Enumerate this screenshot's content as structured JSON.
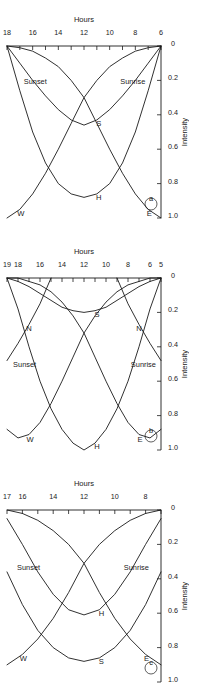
{
  "figure": {
    "orientation_deg": 180,
    "panel_count": 3,
    "ink_color": "#1a1a1a",
    "background": "#ffffff"
  },
  "chart_data": [
    {
      "id": "panel-c",
      "panel_label": "c",
      "type": "line",
      "title": "",
      "xlabel": "Hours",
      "ylabel": "Intensity",
      "xlim": [
        7,
        17
      ],
      "ylim": [
        0,
        1.0
      ],
      "xticks": [
        7,
        8,
        9,
        10,
        11,
        12,
        13,
        14,
        15,
        16,
        17
      ],
      "xticklabels": [
        "",
        "8",
        "",
        "10",
        "",
        "12",
        "",
        "14",
        "",
        "16",
        "17"
      ],
      "yticks": [
        0,
        0.2,
        0.4,
        0.6,
        0.8,
        1.0
      ],
      "yticklabels": [
        "0",
        "0.2",
        "0.4",
        "0.6",
        "0.8",
        "1.0"
      ],
      "grid": false,
      "legend": "inline-curve-labels",
      "annotations": [
        {
          "text": "Sunrise",
          "x": 8.6,
          "y": 0.35
        },
        {
          "text": "Sunset",
          "x": 15.6,
          "y": 0.35
        }
      ],
      "series": [
        {
          "name": "E",
          "label": "E",
          "x": [
            7,
            8,
            9,
            10,
            11,
            12,
            13,
            14,
            15,
            16,
            17
          ],
          "y": [
            0.9,
            0.84,
            0.75,
            0.63,
            0.48,
            0.31,
            0.2,
            0.12,
            0.06,
            0.02,
            0.0
          ]
        },
        {
          "name": "W",
          "label": "W",
          "x": [
            7,
            8,
            9,
            10,
            11,
            12,
            13,
            14,
            15,
            16,
            17
          ],
          "y": [
            0.0,
            0.02,
            0.06,
            0.12,
            0.2,
            0.31,
            0.48,
            0.63,
            0.75,
            0.84,
            0.9
          ]
        },
        {
          "name": "S",
          "label": "S",
          "x": [
            7,
            8,
            9,
            10,
            11,
            12,
            13,
            14,
            15,
            16,
            17
          ],
          "y": [
            0.36,
            0.55,
            0.7,
            0.8,
            0.86,
            0.88,
            0.86,
            0.8,
            0.7,
            0.55,
            0.36
          ]
        },
        {
          "name": "H",
          "label": "H",
          "x": [
            7,
            8,
            9,
            10,
            11,
            12,
            13,
            14,
            15,
            16,
            17
          ],
          "y": [
            0.05,
            0.2,
            0.36,
            0.49,
            0.58,
            0.61,
            0.58,
            0.49,
            0.36,
            0.2,
            0.05
          ]
        }
      ]
    },
    {
      "id": "panel-b",
      "panel_label": "b",
      "type": "line",
      "title": "",
      "xlabel": "Hours",
      "ylabel": "Intensity",
      "xlim": [
        5,
        19
      ],
      "ylim": [
        0,
        1.0
      ],
      "xticks": [
        5,
        6,
        7,
        8,
        9,
        10,
        11,
        12,
        13,
        14,
        15,
        16,
        17,
        18,
        19
      ],
      "xticklabels": [
        "5",
        "6",
        "",
        "8",
        "",
        "10",
        "",
        "12",
        "",
        "14",
        "",
        "16",
        "",
        "18",
        "19"
      ],
      "yticks": [
        0,
        0.2,
        0.4,
        0.6,
        0.8,
        1.0
      ],
      "yticklabels": [
        "0",
        "0.2",
        "0.4",
        "0.6",
        "0.8",
        "1.0"
      ],
      "grid": false,
      "legend": "inline-curve-labels",
      "annotations": [
        {
          "text": "Sunrise",
          "x": 6.6,
          "y": 0.52
        },
        {
          "text": "Sunset",
          "x": 17.4,
          "y": 0.52
        }
      ],
      "series": [
        {
          "name": "E",
          "label": "E",
          "x": [
            5,
            6,
            7,
            8,
            9,
            10,
            11,
            12,
            13,
            14,
            15,
            16,
            17,
            18,
            19
          ],
          "y": [
            0.88,
            0.93,
            0.91,
            0.84,
            0.73,
            0.6,
            0.46,
            0.32,
            0.22,
            0.14,
            0.08,
            0.04,
            0.02,
            0.0,
            0.0
          ]
        },
        {
          "name": "W",
          "label": "W",
          "x": [
            5,
            6,
            7,
            8,
            9,
            10,
            11,
            12,
            13,
            14,
            15,
            16,
            17,
            18,
            19
          ],
          "y": [
            0.0,
            0.0,
            0.02,
            0.04,
            0.08,
            0.14,
            0.22,
            0.32,
            0.46,
            0.6,
            0.73,
            0.84,
            0.91,
            0.93,
            0.88
          ]
        },
        {
          "name": "H",
          "label": "H",
          "x": [
            5,
            6,
            7,
            8,
            9,
            10,
            11,
            12,
            13,
            14,
            15,
            16,
            17,
            18,
            19
          ],
          "y": [
            0.0,
            0.18,
            0.4,
            0.6,
            0.76,
            0.88,
            0.96,
            1.0,
            0.96,
            0.88,
            0.76,
            0.6,
            0.4,
            0.18,
            0.0
          ]
        },
        {
          "name": "S",
          "label": "S",
          "x": [
            5,
            6,
            7,
            8,
            9,
            10,
            11,
            12,
            13,
            14,
            15,
            16,
            17,
            18,
            19
          ],
          "y": [
            0.0,
            0.02,
            0.05,
            0.09,
            0.13,
            0.17,
            0.19,
            0.2,
            0.19,
            0.17,
            0.13,
            0.09,
            0.05,
            0.02,
            0.0
          ]
        },
        {
          "name": "N-morning",
          "label": "N",
          "x": [
            5,
            6,
            7,
            8,
            9
          ],
          "y": [
            0.48,
            0.38,
            0.27,
            0.15,
            0.0
          ]
        },
        {
          "name": "N-evening",
          "label": "N",
          "x": [
            15,
            16,
            17,
            18,
            19
          ],
          "y": [
            0.0,
            0.15,
            0.27,
            0.38,
            0.48
          ]
        }
      ]
    },
    {
      "id": "panel-a",
      "panel_label": "a",
      "type": "line",
      "title": "",
      "xlabel": "Hours",
      "ylabel": "Intensity",
      "xlim": [
        6,
        18
      ],
      "ylim": [
        0,
        1.0
      ],
      "xticks": [
        6,
        7,
        8,
        9,
        10,
        11,
        12,
        13,
        14,
        15,
        16,
        17,
        18
      ],
      "xticklabels": [
        "6",
        "",
        "8",
        "",
        "10",
        "",
        "12",
        "",
        "14",
        "",
        "16",
        "",
        "18"
      ],
      "yticks": [
        0,
        0.2,
        0.4,
        0.6,
        0.8,
        1.0
      ],
      "yticklabels": [
        "0",
        "0.2",
        "0.4",
        "0.6",
        "0.8",
        "1.0"
      ],
      "grid": false,
      "legend": "inline-curve-labels",
      "annotations": [
        {
          "text": "Sunrise",
          "x": 8.2,
          "y": 0.22
        },
        {
          "text": "Sunset",
          "x": 15.8,
          "y": 0.22
        }
      ],
      "series": [
        {
          "name": "E",
          "label": "E",
          "x": [
            6,
            7,
            8,
            9,
            10,
            11,
            12,
            13,
            14,
            15,
            16,
            17,
            18
          ],
          "y": [
            1.0,
            0.95,
            0.86,
            0.74,
            0.6,
            0.45,
            0.3,
            0.2,
            0.12,
            0.07,
            0.03,
            0.01,
            0.0
          ]
        },
        {
          "name": "W",
          "label": "W",
          "x": [
            6,
            7,
            8,
            9,
            10,
            11,
            12,
            13,
            14,
            15,
            16,
            17,
            18
          ],
          "y": [
            0.0,
            0.01,
            0.03,
            0.07,
            0.12,
            0.2,
            0.3,
            0.45,
            0.6,
            0.74,
            0.86,
            0.95,
            1.0
          ]
        },
        {
          "name": "H",
          "label": "H",
          "x": [
            6,
            7,
            8,
            9,
            10,
            11,
            12,
            13,
            14,
            15,
            16,
            17,
            18
          ],
          "y": [
            0.0,
            0.26,
            0.5,
            0.68,
            0.8,
            0.86,
            0.88,
            0.86,
            0.8,
            0.68,
            0.5,
            0.26,
            0.0
          ]
        },
        {
          "name": "S",
          "label": "S",
          "x": [
            6,
            7,
            8,
            9,
            10,
            11,
            12,
            13,
            14,
            15,
            16,
            17,
            18
          ],
          "y": [
            0.0,
            0.1,
            0.2,
            0.29,
            0.37,
            0.43,
            0.46,
            0.43,
            0.37,
            0.29,
            0.2,
            0.1,
            0.0
          ]
        }
      ]
    }
  ]
}
